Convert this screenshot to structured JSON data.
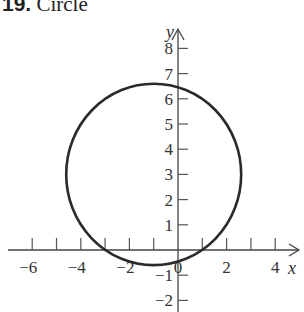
{
  "header": {
    "number": "19.",
    "label": "Circle"
  },
  "chart_data": {
    "type": "line",
    "title": "Circle",
    "xlabel": "x",
    "ylabel": "y",
    "xlim": [
      -6.5,
      5
    ],
    "ylim": [
      -2.5,
      9
    ],
    "x_ticks": [
      -6,
      -5,
      -4,
      -3,
      -2,
      -1,
      0,
      1,
      2,
      3,
      4
    ],
    "x_tick_labels": [
      "-6",
      "-4",
      "-2",
      "0",
      "2",
      "4"
    ],
    "y_ticks": [
      -2,
      -1,
      1,
      2,
      3,
      4,
      5,
      6,
      7,
      8
    ],
    "y_tick_labels": [
      "-2",
      "-1",
      "1",
      "2",
      "3",
      "4",
      "5",
      "6",
      "7",
      "8"
    ],
    "grid": false,
    "series": [
      {
        "name": "circle",
        "shape": "circle",
        "center": [
          -1,
          3
        ],
        "radius": 3.6
      }
    ]
  }
}
